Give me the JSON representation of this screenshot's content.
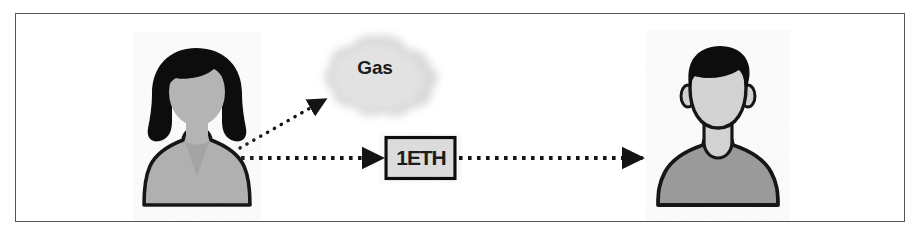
{
  "diagram": {
    "frame": {
      "border_color": "#55565a",
      "background": "#ffffff"
    },
    "nodes": [
      {
        "id": "sender",
        "name": "sender-avatar",
        "type": "person-avatar-female",
        "label": "",
        "hair_color": "#101010",
        "face_color": "#b4b4b4",
        "body_color": "#b0b0b0",
        "outline_color": "#151515"
      },
      {
        "id": "gas",
        "name": "gas-cloud",
        "type": "cloud",
        "label": "Gas",
        "fill_color": "#d9d9d9",
        "text_color": "#1c1c1c"
      },
      {
        "id": "amount",
        "name": "eth-amount-box",
        "type": "box",
        "label": "1ETH",
        "fill_color": "#dcdcdc",
        "border_color": "#101010",
        "text_color": "#101010"
      },
      {
        "id": "receiver",
        "name": "receiver-avatar",
        "type": "person-avatar-male",
        "label": "",
        "hair_color": "#101010",
        "face_color": "#d2d2d2",
        "body_color": "#9a9a9a",
        "outline_color": "#151515"
      }
    ],
    "edges": [
      {
        "id": "sender-to-gas",
        "name": "arrow-sender-to-gas",
        "from": "sender",
        "to": "gas",
        "style": "dotted",
        "label": "",
        "color": "#141414"
      },
      {
        "id": "sender-to-amount",
        "name": "arrow-sender-to-eth",
        "from": "sender",
        "to": "amount",
        "style": "dotted",
        "label": "",
        "color": "#141414"
      },
      {
        "id": "amount-to-receiver",
        "name": "arrow-eth-to-receiver",
        "from": "amount",
        "to": "receiver",
        "style": "dotted",
        "label": "",
        "color": "#141414"
      }
    ]
  }
}
